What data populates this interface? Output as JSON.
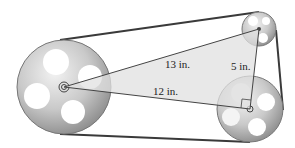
{
  "diagram": {
    "labels": {
      "hypotenuse": "13 in.",
      "long_leg": "12 in.",
      "short_leg": "5 in."
    },
    "pulleys": [
      {
        "name": "large-pulley",
        "cx": 64,
        "cy": 87,
        "r": 47
      },
      {
        "name": "small-top-pulley",
        "cx": 259,
        "cy": 29,
        "r": 17
      },
      {
        "name": "medium-bottom-pulley",
        "cx": 250,
        "cy": 109,
        "r": 33
      }
    ],
    "triangle": {
      "vertices": [
        [
          64,
          87
        ],
        [
          259,
          29
        ],
        [
          250,
          109
        ]
      ],
      "right_angle_at": [
        250,
        109
      ]
    },
    "colors": {
      "belt": "#3a3a3a",
      "pulley_fill": "#c8c8c8",
      "pulley_edge": "#777777",
      "triangle_fill": "#e4e4e4",
      "line": "#444444"
    }
  }
}
